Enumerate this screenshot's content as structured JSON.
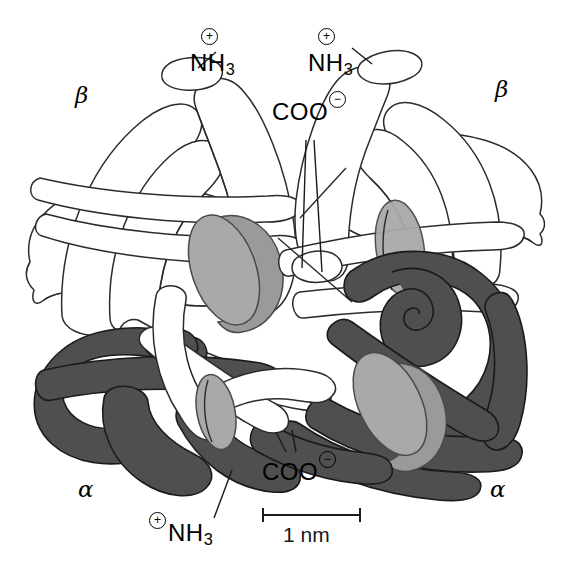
{
  "figure": {
    "background_color": "#ffffff",
    "width": 565,
    "height": 574
  },
  "colors": {
    "alpha_chain": "#4f4f4f",
    "beta_chain": "#ffffff",
    "heme_face": "#a9a9a9",
    "heme_edge": "#8f8f8f",
    "heme_dark": "#5a5a5a",
    "outline": "#1a1a1a",
    "text": "#000000"
  },
  "subunit_labels": {
    "beta_left": "β",
    "beta_right": "β",
    "alpha_left": "α",
    "alpha_right": "α"
  },
  "terminus_labels": {
    "amino_top_left": {
      "text": "NH",
      "subscript": "3",
      "charge": "+"
    },
    "amino_top_right": {
      "text": "NH",
      "subscript": "3",
      "charge": "+"
    },
    "amino_bottom": {
      "text": "NH",
      "subscript": "3",
      "charge": "+"
    },
    "carboxyl_top": {
      "text": "COO",
      "charge": "−"
    },
    "carboxyl_bottom": {
      "text": "COO",
      "charge": "−"
    }
  },
  "scale_bar": {
    "label": "1 nm",
    "length_px": 97,
    "units": "nm",
    "value": 1
  }
}
